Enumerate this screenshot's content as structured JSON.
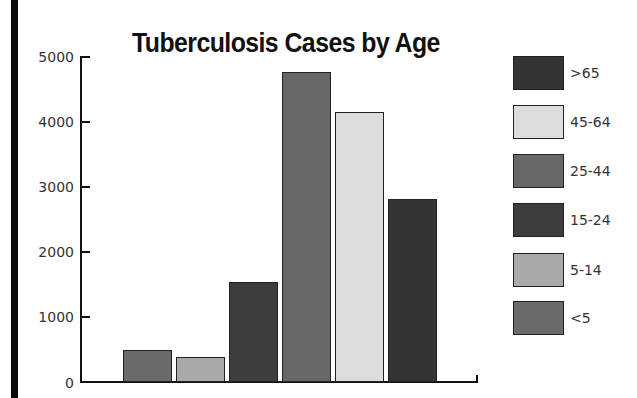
{
  "chart_data": {
    "type": "bar",
    "title": "Tuberculosis Cases by Age",
    "xlabel": "",
    "ylabel": "",
    "ylim": [
      0,
      5000
    ],
    "yticks": [
      0,
      1000,
      2000,
      3000,
      4000,
      5000
    ],
    "grid": false,
    "legend_position": "right",
    "categories": [
      "<5",
      "5-14",
      "15-24",
      "25-44",
      "45-64",
      ">65"
    ],
    "values": [
      490,
      385,
      1535,
      4755,
      4140,
      2805
    ],
    "colors": [
      "#6a6a6a",
      "#a9a9a9",
      "#3d3d3d",
      "#676767",
      "#dcdcdc",
      "#343434"
    ],
    "legend": [
      {
        "label": ">65",
        "color": "#343434"
      },
      {
        "label": "45-64",
        "color": "#dcdcdc"
      },
      {
        "label": "25-44",
        "color": "#676767"
      },
      {
        "label": "15-24",
        "color": "#3d3d3d"
      },
      {
        "label": "5-14",
        "color": "#a9a9a9"
      },
      {
        "label": "<5",
        "color": "#6a6a6a"
      }
    ]
  },
  "labels": {
    "title": "Tuberculosis Cases by Age",
    "yticks": [
      "0",
      "1000",
      "2000",
      "3000",
      "4000",
      "5000"
    ],
    "legend": [
      ">65",
      "45-64",
      "25-44",
      "15-24",
      "5-14",
      "<5"
    ]
  }
}
